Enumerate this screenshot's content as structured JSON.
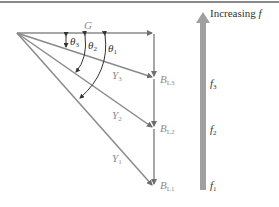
{
  "diagram": {
    "title_arrow": {
      "label_text": "Increasing ",
      "label_var": "f"
    },
    "vectors": {
      "G": "G",
      "Y1": {
        "base": "Y",
        "sub": "1"
      },
      "Y2": {
        "base": "Y",
        "sub": "2"
      },
      "Y3": {
        "base": "Y",
        "sub": "3"
      },
      "BL1": {
        "base": "B",
        "sub": "L1"
      },
      "BL2": {
        "base": "B",
        "sub": "L2"
      },
      "BL3": {
        "base": "B",
        "sub": "L3"
      }
    },
    "angles": {
      "theta1": {
        "base": "θ",
        "sub": "1"
      },
      "theta2": {
        "base": "θ",
        "sub": "2"
      },
      "theta3": {
        "base": "θ",
        "sub": "3"
      }
    },
    "frequencies": {
      "f1": {
        "base": "f",
        "sub": "1"
      },
      "f2": {
        "base": "f",
        "sub": "2"
      },
      "f3": {
        "base": "f",
        "sub": "3"
      }
    },
    "colors": {
      "line": "#8a8a8a",
      "arrow_band": "#a0a0a0",
      "text_dark": "#333333",
      "text_light": "#8c8c8c"
    }
  }
}
